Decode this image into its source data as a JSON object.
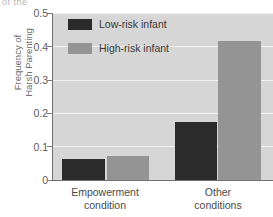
{
  "figure": {
    "clipped_caption": "of the",
    "background_color": "#ffffff",
    "plot_background_color": "#d6d6d6",
    "gridline_color": "#f2f2f2",
    "axis_color": "#6f6f6f"
  },
  "axes": {
    "ylabel_line1": "Frequency of",
    "ylabel_line2": "Harsh Parenting",
    "ylabel": "Frequency of\nHarsh Parenting",
    "ytick_labels": [
      "0.5",
      "0.4",
      "0.3",
      "0.2",
      "0.1",
      "0"
    ],
    "ytick_values": [
      0.5,
      0.4,
      0.3,
      0.2,
      0.1,
      0
    ],
    "xtick_labels": [
      "Empowerment\ncondition",
      "Other\nconditions"
    ],
    "xtick_label_1_line1": "Empowerment",
    "xtick_label_1_line2": "condition",
    "xtick_label_2_line1": "Other",
    "xtick_label_2_line2": "conditions"
  },
  "legend": {
    "position": "upper-left-inside",
    "entries": [
      {
        "label": "Low-risk infant",
        "color": "#2b2b2b"
      },
      {
        "label": "High-risk infant",
        "color": "#949494"
      }
    ]
  },
  "chart_data": {
    "type": "bar",
    "title": "",
    "xlabel": "",
    "ylabel": "Frequency of Harsh Parenting",
    "ylim": [
      0,
      0.5
    ],
    "yticks": [
      0,
      0.1,
      0.2,
      0.3,
      0.4,
      0.5
    ],
    "grid": true,
    "categories": [
      "Empowerment condition",
      "Other conditions"
    ],
    "series": [
      {
        "name": "Low-risk infant",
        "color": "#2b2b2b",
        "values": [
          0.063,
          0.173
        ]
      },
      {
        "name": "High-risk infant",
        "color": "#949494",
        "values": [
          0.072,
          0.416
        ]
      }
    ]
  }
}
